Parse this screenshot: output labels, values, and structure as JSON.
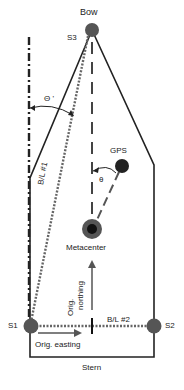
{
  "diagram": {
    "labels": {
      "bow": "Bow",
      "stern": "Stern",
      "s1": "S1",
      "s2": "S2",
      "s3": "S3",
      "gps": "GPS",
      "metacenter": "Metacenter",
      "theta": "θ",
      "theta_prime": "Θ '",
      "bl1": "B/L #1",
      "bl2": "B/L #2",
      "orig_easting": "Orig. easting",
      "orig_northing_1": "Orig.",
      "orig_northing_2": "northing"
    },
    "colors": {
      "line": "#222222",
      "dot": "#555555",
      "dashed": "#777777",
      "arrow": "#555555"
    }
  }
}
